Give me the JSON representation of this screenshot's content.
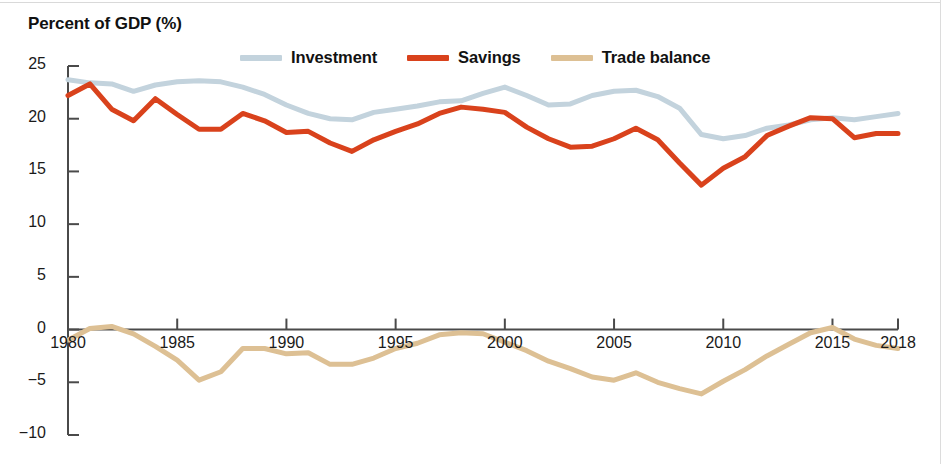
{
  "figure": {
    "axis_title": "Percent of GDP (%)"
  },
  "legend": {
    "position": "top-center",
    "items": [
      {
        "label": "Investment",
        "color": "#c3d3dd",
        "name": "investment"
      },
      {
        "label": "Savings",
        "color": "#d9421c",
        "name": "savings"
      },
      {
        "label": "Trade balance",
        "color": "#ddc094",
        "name": "trade-balance"
      }
    ]
  },
  "chart_data": {
    "type": "line",
    "title": "",
    "subtitle": "",
    "xlabel": "",
    "ylabel": "Percent of GDP (%)",
    "xlim": [
      1980,
      2018
    ],
    "ylim": [
      -10,
      25
    ],
    "grid": false,
    "legend_position": "top-center",
    "x_ticks": [
      1980,
      1985,
      1990,
      1995,
      2000,
      2005,
      2010,
      2015,
      2018
    ],
    "y_ticks": [
      25,
      20,
      15,
      10,
      5,
      0,
      -5,
      -10
    ],
    "y_tick_labels": [
      "25",
      "20",
      "15",
      "10",
      "5",
      "0",
      "−5",
      "−10"
    ],
    "x": [
      1980,
      1981,
      1982,
      1983,
      1984,
      1985,
      1986,
      1987,
      1988,
      1989,
      1990,
      1991,
      1992,
      1993,
      1994,
      1995,
      1996,
      1997,
      1998,
      1999,
      2000,
      2001,
      2002,
      2003,
      2004,
      2005,
      2006,
      2007,
      2008,
      2009,
      2010,
      2011,
      2012,
      2013,
      2014,
      2015,
      2016,
      2017,
      2018
    ],
    "series": [
      {
        "name": "Investment",
        "color": "#c3d3dd",
        "width": 5,
        "values": [
          23.7,
          23.4,
          23.3,
          22.6,
          23.2,
          23.5,
          23.6,
          23.5,
          23.0,
          22.3,
          21.3,
          20.5,
          20.0,
          19.9,
          20.6,
          20.9,
          21.2,
          21.6,
          21.7,
          22.4,
          23.0,
          22.2,
          21.3,
          21.4,
          22.2,
          22.6,
          22.7,
          22.1,
          21.0,
          18.5,
          18.1,
          18.4,
          19.1,
          19.4,
          19.9,
          20.1,
          19.9,
          20.2,
          20.5
        ]
      },
      {
        "name": "Savings",
        "color": "#d9421c",
        "width": 5,
        "values": [
          22.2,
          23.3,
          20.9,
          19.8,
          21.9,
          20.4,
          19.0,
          19.0,
          20.5,
          19.8,
          18.7,
          18.8,
          17.7,
          16.9,
          18.0,
          18.8,
          19.5,
          20.5,
          21.1,
          20.9,
          20.6,
          19.2,
          18.1,
          17.3,
          17.4,
          18.1,
          19.1,
          18.0,
          15.8,
          13.7,
          15.3,
          16.4,
          18.4,
          19.3,
          20.1,
          20.0,
          18.2,
          18.6,
          18.6
        ]
      },
      {
        "name": "Trade balance",
        "color": "#ddc094",
        "width": 5,
        "values": [
          -1.0,
          0.1,
          0.3,
          -0.4,
          -1.6,
          -2.9,
          -4.8,
          -4.0,
          -1.8,
          -1.8,
          -2.3,
          -2.2,
          -3.3,
          -3.3,
          -2.7,
          -1.8,
          -1.3,
          -0.5,
          -0.3,
          -0.4,
          -1.2,
          -2.0,
          -3.0,
          -3.7,
          -4.5,
          -4.8,
          -4.1,
          -5.0,
          -5.6,
          -6.1,
          -4.9,
          -3.8,
          -2.5,
          -1.4,
          -0.3,
          0.2,
          -0.9,
          -1.5,
          -1.8
        ]
      }
    ]
  },
  "axes": {
    "x_axis_name": "year-axis",
    "y_axis_name": "percent-axis"
  }
}
